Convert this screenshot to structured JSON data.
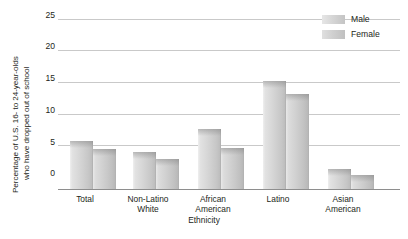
{
  "chart_data": {
    "type": "bar",
    "title": "",
    "xlabel": "Ethnicity",
    "ylabel": "Percentage of U.S. 16- to 24-year-olds who have dropped out of school",
    "ylabel_lines": [
      "Percentage of U.S. 16- to 24-year-olds",
      "who have dropped out of school"
    ],
    "categories": [
      "Total",
      "Non-Latino White",
      "African American",
      "Latino",
      "Asian American"
    ],
    "category_lines": [
      [
        "Total"
      ],
      [
        "Non-Latino",
        "White"
      ],
      [
        "African",
        "American"
      ],
      [
        "Latino"
      ],
      [
        "Asian",
        "American"
      ]
    ],
    "series": [
      {
        "name": "Male",
        "values": [
          7.0,
          5.5,
          8.8,
          15.9,
          2.9
        ]
      },
      {
        "name": "Female",
        "values": [
          5.9,
          4.4,
          6.1,
          13.9,
          2.1
        ]
      }
    ],
    "ylim": [
      0,
      25
    ],
    "yticks": [
      25,
      20,
      15,
      10,
      5,
      0
    ],
    "ytick_labels": [
      "25",
      "20",
      "15",
      "10",
      "5",
      "0"
    ],
    "grid": true,
    "legend_position": "top-right",
    "colors": {
      "male": "#d2d2d2",
      "female": "#cccccc",
      "gridline": "#c9c9c9",
      "axis": "#8e8e8e",
      "text": "#231f20"
    }
  },
  "legend": {
    "items": [
      {
        "label": "Male"
      },
      {
        "label": "Female"
      }
    ]
  }
}
